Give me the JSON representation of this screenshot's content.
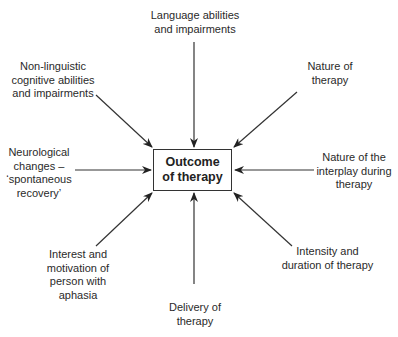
{
  "diagram": {
    "center": {
      "label": "Outcome\nof therapy"
    },
    "factors": [
      {
        "id": "language",
        "label": "Language abilities\nand impairments",
        "position": "top"
      },
      {
        "id": "non-linguistic",
        "label": "Non-linguistic\ncognitive abilities\nand impairments",
        "position": "top-left"
      },
      {
        "id": "nature-of-therapy",
        "label": "Nature of\ntherapy",
        "position": "top-right"
      },
      {
        "id": "neurological",
        "label": "Neurological\nchanges –\n‘spontaneous\nrecovery’",
        "position": "left"
      },
      {
        "id": "interplay",
        "label": "Nature of the\ninterplay during\ntherapy",
        "position": "right"
      },
      {
        "id": "interest",
        "label": "Interest and\nmotivation of\nperson with\naphasia",
        "position": "bottom-left"
      },
      {
        "id": "delivery",
        "label": "Delivery of\ntherapy",
        "position": "bottom"
      },
      {
        "id": "intensity",
        "label": "Intensity and\nduration of therapy",
        "position": "bottom-right"
      }
    ],
    "colors": {
      "line": "#333333",
      "text": "#2a2a2a",
      "background": "#ffffff"
    }
  }
}
